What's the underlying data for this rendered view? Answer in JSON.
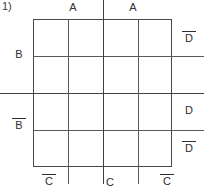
{
  "figure": {
    "number_label": "1)",
    "kind": "karnaugh-map",
    "grid": {
      "rows": 4,
      "cols": 4
    }
  },
  "labels": {
    "top": [
      {
        "text": "A",
        "overbar": false
      },
      {
        "text": "A",
        "overbar": false
      }
    ],
    "bottom": [
      {
        "text": "C",
        "overbar": true
      },
      {
        "text": "C",
        "overbar": false
      },
      {
        "text": "C",
        "overbar": true
      }
    ],
    "left": [
      {
        "text": "B",
        "overbar": false
      },
      {
        "text": "B",
        "overbar": true
      }
    ],
    "right": [
      {
        "text": "D",
        "overbar": true
      },
      {
        "text": "D",
        "overbar": false
      },
      {
        "text": "D",
        "overbar": true
      }
    ]
  },
  "top_labels": {
    "a_left": "A",
    "a_right": "A"
  },
  "bottom_labels": {
    "c_bar_left": "C",
    "c_mid": "C",
    "c_bar_right": "C"
  },
  "left_labels": {
    "b": "B",
    "b_bar": "B"
  },
  "right_labels": {
    "d_bar_top": "D",
    "d_mid": "D",
    "d_bar_bottom": "D"
  },
  "shaded_region": {
    "description": "middle two columns hatched",
    "columns": [
      2,
      3
    ],
    "rows": [
      1,
      2,
      3,
      4
    ],
    "pattern": "diagonal-hatch-45"
  },
  "colors": {
    "ink": "#2e2e2e",
    "rule": "#5a5a5a",
    "border": "#4a4a4a",
    "hatch": "#6b6b6b",
    "background": "#ffffff"
  }
}
